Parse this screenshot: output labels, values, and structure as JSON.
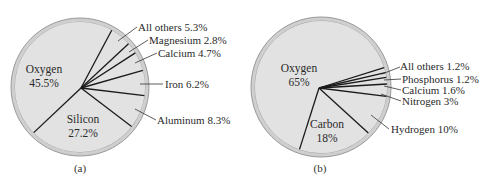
{
  "chart_data": [
    {
      "type": "pie",
      "caption": "(a)",
      "title": "",
      "slices": [
        {
          "label": "Oxygen",
          "value": 45.5,
          "display": "45.5%",
          "placement": "inside"
        },
        {
          "label": "Silicon",
          "value": 27.2,
          "display": "27.2%",
          "placement": "inside"
        },
        {
          "label": "Aluminum",
          "value": 8.3,
          "display": "Aluminum 8.3%",
          "placement": "outside"
        },
        {
          "label": "Iron",
          "value": 6.2,
          "display": "Iron 6.2%",
          "placement": "outside"
        },
        {
          "label": "Calcium",
          "value": 4.7,
          "display": "Calcium 4.7%",
          "placement": "outside"
        },
        {
          "label": "Magnesium",
          "value": 2.8,
          "display": "Magnesium 2.8%",
          "placement": "outside"
        },
        {
          "label": "All others",
          "value": 5.3,
          "display": "All others 5.3%",
          "placement": "outside"
        }
      ]
    },
    {
      "type": "pie",
      "caption": "(b)",
      "title": "",
      "slices": [
        {
          "label": "Oxygen",
          "value": 65,
          "display": "65%",
          "placement": "inside"
        },
        {
          "label": "Carbon",
          "value": 18,
          "display": "18%",
          "placement": "inside"
        },
        {
          "label": "Hydrogen",
          "value": 10,
          "display": "Hydrogen 10%",
          "placement": "outside"
        },
        {
          "label": "Nitrogen",
          "value": 3,
          "display": "Nitrogen 3%",
          "placement": "outside"
        },
        {
          "label": "Calcium",
          "value": 1.6,
          "display": "Calcium 1.6%",
          "placement": "outside"
        },
        {
          "label": "Phosphorus",
          "value": 1.2,
          "display": "Phosphorus 1.2%",
          "placement": "outside"
        },
        {
          "label": "All others",
          "value": 1.2,
          "display": "All others 1.2%",
          "placement": "outside"
        }
      ]
    }
  ],
  "colors": {
    "slice_fill": "#e2e2e2",
    "rim": "#cfcfcf",
    "rim_edge": "#9a9a9a",
    "spoke": "#1a1a1a",
    "leader": "#333333"
  }
}
